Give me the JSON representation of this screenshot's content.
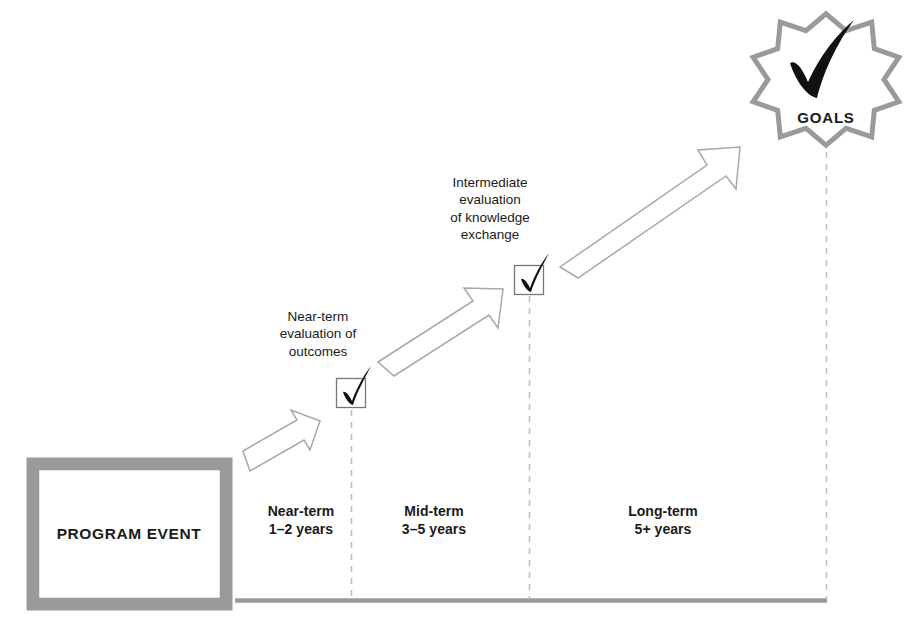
{
  "diagram": {
    "colors": {
      "gray": "#9a9a9a",
      "baseline": "#9a9a9a",
      "arrow_stroke": "#a8a8a8",
      "dash": "#bdbdbd",
      "check": "#111111",
      "text": "#1a1a1a",
      "box_fill": "#ffffff"
    }
  },
  "program_event": {
    "label": "PROGRAM EVENT"
  },
  "phases": [
    {
      "id": "near",
      "name": "Near-term",
      "duration": "1–2 years"
    },
    {
      "id": "mid",
      "name": "Mid-term",
      "duration": "3–5 years"
    },
    {
      "id": "long",
      "name": "Long-term",
      "duration": "5+ years"
    }
  ],
  "milestones": [
    {
      "id": "near-term-evaluation",
      "lines": [
        "Near-term",
        "evaluation of",
        "outcomes"
      ],
      "checked": true
    },
    {
      "id": "intermediate-evaluation",
      "lines": [
        "Intermediate",
        "evaluation",
        "of knowledge",
        "exchange"
      ],
      "checked": true
    }
  ],
  "goals": {
    "label": "GOALS",
    "checked": true
  },
  "arrows": [
    {
      "id": "arrow-near",
      "direction": "up-right"
    },
    {
      "id": "arrow-mid",
      "direction": "up-right"
    },
    {
      "id": "arrow-long",
      "direction": "up-right"
    }
  ]
}
